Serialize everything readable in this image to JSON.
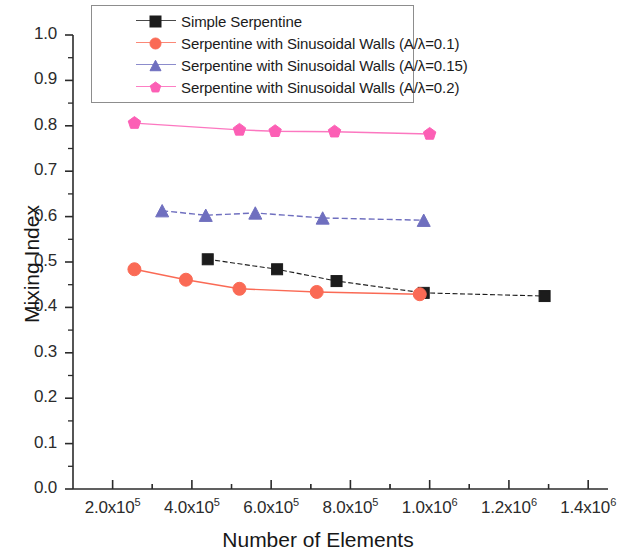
{
  "chart_data": {
    "type": "line",
    "title": "",
    "xlabel": "Number of Elements",
    "ylabel": "Mixing Index",
    "xlim": [
      100000,
      1450000
    ],
    "ylim": [
      0.0,
      1.0
    ],
    "grid": false,
    "legend_position": "top-center-inside",
    "xticks": [
      {
        "value": 200000,
        "label": "2.0x10",
        "exp": "5"
      },
      {
        "value": 400000,
        "label": "4.0x10",
        "exp": "5"
      },
      {
        "value": 600000,
        "label": "6.0x10",
        "exp": "5"
      },
      {
        "value": 800000,
        "label": "8.0x10",
        "exp": "5"
      },
      {
        "value": 1000000,
        "label": "1.0x10",
        "exp": "6"
      },
      {
        "value": 1200000,
        "label": "1.2x10",
        "exp": "6"
      },
      {
        "value": 1400000,
        "label": "1.4x10",
        "exp": "6"
      }
    ],
    "yticks": [
      "0.0",
      "0.1",
      "0.2",
      "0.3",
      "0.4",
      "0.5",
      "0.6",
      "0.7",
      "0.8",
      "0.9",
      "1.0"
    ],
    "series": [
      {
        "name": "Simple Serpentine",
        "legend_label": "Simple Serpentine",
        "color": "#1c1c1c",
        "marker": "square",
        "x": [
          440000,
          615000,
          765000,
          985000,
          1290000
        ],
        "values": [
          0.506,
          0.484,
          0.458,
          0.432,
          0.425
        ]
      },
      {
        "name": "Serpentine with Sinusoidal Walls (A/lambda=0.1)",
        "legend_label": "Serpentine with Sinusoidal Walls (A/λ=0.1)",
        "color": "#fa6a55",
        "marker": "circle",
        "x": [
          255000,
          385000,
          520000,
          715000,
          975000
        ],
        "values": [
          0.484,
          0.461,
          0.441,
          0.434,
          0.429
        ]
      },
      {
        "name": "Serpentine with Sinusoidal Walls (A/lambda=0.15)",
        "legend_label": "Serpentine with Sinusoidal Walls (A/λ=0.15)",
        "color": "#6f6fbf",
        "marker": "triangle",
        "x": [
          325000,
          435000,
          560000,
          730000,
          985000
        ],
        "values": [
          0.613,
          0.603,
          0.608,
          0.597,
          0.592
        ]
      },
      {
        "name": "Serpentine with Sinusoidal Walls (A/lambda=0.2)",
        "legend_label": "Serpentine with Sinusoidal Walls (A/λ=0.2)",
        "color": "#fc5fb5",
        "marker": "pentagon",
        "x": [
          255000,
          520000,
          610000,
          760000,
          1000000
        ],
        "values": [
          0.806,
          0.791,
          0.788,
          0.787,
          0.782
        ]
      }
    ]
  },
  "axes": {
    "y_title": "Mixing Index",
    "x_title": "Number of Elements"
  }
}
